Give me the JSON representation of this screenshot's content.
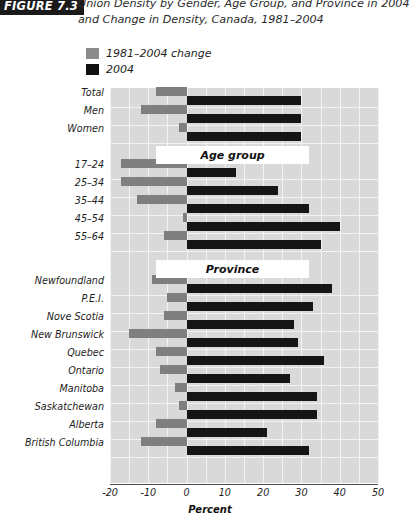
{
  "figure": {
    "tag": "FIGURE 7.3",
    "title": "Union Density by Gender, Age Group, and Province in 2004 and Change in Density, Canada, 1981–2004"
  },
  "legend": {
    "items": [
      {
        "label": "1981–2004 change",
        "color": "#8c8c8c",
        "swatch": "gray-swatch"
      },
      {
        "label": "2004",
        "color": "#111111",
        "swatch": "black-swatch"
      }
    ]
  },
  "bands": [
    {
      "label": "Age group"
    },
    {
      "label": "Province"
    }
  ],
  "chart_data": {
    "type": "bar",
    "orientation": "horizontal",
    "title": "Union Density by Gender, Age Group, and Province in 2004 and Change in Density, Canada, 1981–2004",
    "xlabel": "Percent",
    "ylabel": "",
    "xlim": [
      -20,
      50
    ],
    "xticks": [
      -20,
      -10,
      0,
      10,
      20,
      30,
      40,
      50
    ],
    "xtick_labels": [
      "-20",
      "-10",
      "0",
      "10",
      "20",
      "30",
      "40",
      "50"
    ],
    "grid": true,
    "gridline_step": 5,
    "legend_position": "top-left",
    "categories": [
      "Total",
      "Men",
      "Women",
      "17–24",
      "25–34",
      "35–44",
      "45–54",
      "55–64",
      "Newfoundland",
      "P.E.I.",
      "Nove Scotia",
      "New Brunswick",
      "Quebec",
      "Ontario",
      "Manitoba",
      "Saskatchewan",
      "Alberta",
      "British Columbia"
    ],
    "group_bands": {
      "Age group": [
        "17–24",
        "25–34",
        "35–44",
        "45–54",
        "55–64"
      ],
      "Province": [
        "Newfoundland",
        "P.E.I.",
        "Nove Scotia",
        "New Brunswick",
        "Quebec",
        "Ontario",
        "Manitoba",
        "Saskatchewan",
        "Alberta",
        "British Columbia"
      ]
    },
    "series": [
      {
        "name": "2004",
        "color": "#111111",
        "values": [
          30,
          30,
          30,
          13,
          24,
          32,
          40,
          35,
          38,
          33,
          28,
          29,
          36,
          27,
          34,
          34,
          21,
          32
        ]
      },
      {
        "name": "1981–2004 change",
        "color": "#8c8c8c",
        "values": [
          -8,
          -12,
          -2,
          -17,
          -17,
          -13,
          -1,
          -6,
          -9,
          -5,
          -6,
          -15,
          -8,
          -7,
          -3,
          -2,
          -8,
          -12
        ]
      }
    ]
  }
}
